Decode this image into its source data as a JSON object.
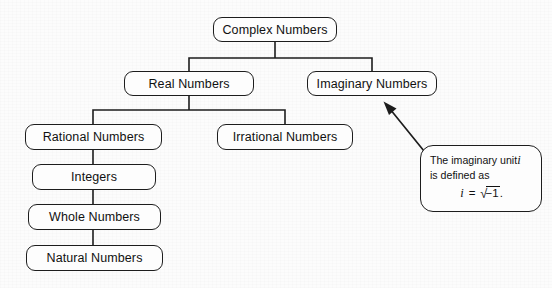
{
  "diagram": {
    "nodes": {
      "complex": "Complex Numbers",
      "real": "Real Numbers",
      "imaginary": "Imaginary Numbers",
      "rational": "Rational Numbers",
      "irrational": "Irrational Numbers",
      "integers": "Integers",
      "whole": "Whole Numbers",
      "natural": "Natural Numbers"
    },
    "callout": {
      "line1": "The imaginary unit",
      "line1_var": "i",
      "line2": "is defined as",
      "formula_var": "i",
      "formula_eq": "=",
      "formula_radical": "√",
      "formula_radicand": "−1",
      "formula_period": "."
    },
    "colors": {
      "stroke": "#1d1d1d",
      "text": "#111111",
      "background": "#fcfcfc",
      "node_fill": "#fdfdfd"
    }
  }
}
